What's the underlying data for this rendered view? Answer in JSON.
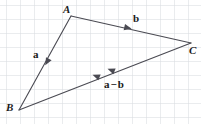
{
  "figure": {
    "canvas": {
      "width": 201,
      "height": 124
    },
    "background_color": "#ffffff",
    "grid": {
      "visible": true,
      "color": "#d6d9de",
      "cell_size": 14,
      "origin_x": 6,
      "origin_y": 5,
      "line_width": 1
    },
    "stroke_color": "#4a4a52",
    "text_color": "#1a1a1a",
    "vertices": [
      {
        "id": "A",
        "label": "A",
        "x": 71,
        "y": 16,
        "label_x": 63,
        "label_y": 4
      },
      {
        "id": "B",
        "label": "B",
        "x": 19,
        "y": 110,
        "label_x": 6,
        "label_y": 102
      },
      {
        "id": "C",
        "label": "C",
        "x": 191,
        "y": 43,
        "label_x": 189,
        "label_y": 45
      }
    ],
    "edges": [
      {
        "id": "AB",
        "from": "A",
        "to": "B",
        "x1": 71,
        "y1": 16,
        "x2": 19,
        "y2": 110
      },
      {
        "id": "AC",
        "from": "A",
        "to": "C",
        "x1": 71,
        "y1": 16,
        "x2": 191,
        "y2": 43
      },
      {
        "id": "CB",
        "from": "C",
        "to": "B",
        "x1": 191,
        "y1": 43,
        "x2": 19,
        "y2": 110
      }
    ],
    "vectors": [
      {
        "id": "a",
        "label": "a",
        "label_html": "a",
        "on_edge": "AB",
        "direction": "A-to-B",
        "label_x": 33,
        "label_y": 49,
        "arrow_count": 1,
        "arrows": [
          {
            "x": 47,
            "y": 62,
            "angle_deg": 118.9
          }
        ]
      },
      {
        "id": "b",
        "label": "b",
        "label_html": "b",
        "on_edge": "AC",
        "direction": "A-to-C",
        "label_x": 133,
        "label_y": 13,
        "arrow_count": 1,
        "arrows": [
          {
            "x": 128,
            "y": 28,
            "angle_deg": 12.7
          }
        ]
      },
      {
        "id": "a-minus-b",
        "label": "a − b",
        "label_lhs": "a",
        "label_op": "−",
        "label_rhs": "b",
        "on_edge": "CB",
        "direction": "C-to-B",
        "label_x": 104,
        "label_y": 79,
        "arrow_count": 2,
        "arrows": [
          {
            "x": 111,
            "y": 70,
            "angle_deg": 201.3
          },
          {
            "x": 96,
            "y": 76,
            "angle_deg": 201.3
          }
        ]
      }
    ]
  }
}
